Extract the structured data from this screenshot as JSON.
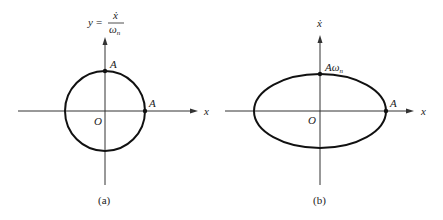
{
  "diagram": {
    "panels": [
      {
        "id": "a",
        "caption": "(a)",
        "shape": "circle",
        "origin_label": "O",
        "x_axis_label": "x",
        "y_axis_label_lhs": "y",
        "y_axis_label_eq": "=",
        "y_axis_label_num": "ẋ",
        "y_axis_label_den": "ω",
        "y_axis_label_den_sub": "n",
        "top_point_label": "A",
        "right_point_label": "A"
      },
      {
        "id": "b",
        "caption": "(b)",
        "shape": "ellipse",
        "origin_label": "O",
        "x_axis_label": "x",
        "y_axis_label": "ẋ",
        "top_point_label_main": "Aω",
        "top_point_label_sub": "n",
        "right_point_label": "A"
      }
    ],
    "colors": {
      "stroke": "#111111",
      "axis": "#333333",
      "background": "#ffffff"
    }
  }
}
